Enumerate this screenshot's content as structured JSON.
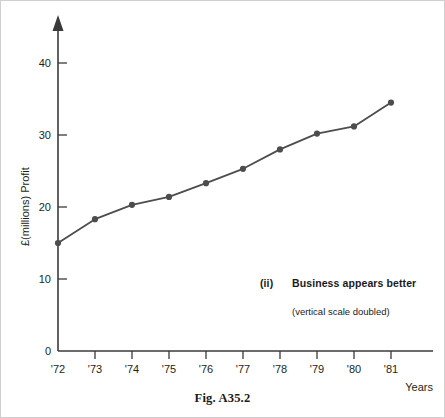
{
  "figure": {
    "caption": "Fig. A35.2"
  },
  "annotation": {
    "marker": "(ii)",
    "title": "Business appears better",
    "subtitle": "(vertical scale doubled)"
  },
  "chart_data": {
    "type": "line",
    "title": "",
    "xlabel": "Years",
    "ylabel": "£(millions) Profit",
    "categories": [
      "'72",
      "'73",
      "'74",
      "'75",
      "'76",
      "'77",
      "'78",
      "'79",
      "'80",
      "'81"
    ],
    "values": [
      15.0,
      18.3,
      20.3,
      21.4,
      23.3,
      25.3,
      28.0,
      30.2,
      31.2,
      34.5
    ],
    "series": [
      {
        "name": "Profit",
        "values": [
          15.0,
          18.3,
          20.3,
          21.4,
          23.3,
          25.3,
          28.0,
          30.2,
          31.2,
          34.5
        ]
      }
    ],
    "ylim": [
      0,
      45
    ],
    "yticks": [
      0,
      10,
      20,
      30,
      40
    ],
    "ytick_labels": [
      "0",
      "10",
      "20",
      "30",
      "40"
    ],
    "xtick_labels": [
      "'72",
      "'73",
      "'74",
      "'75",
      "'76",
      "'77",
      "'78",
      "'79",
      "'80",
      "'81"
    ],
    "grid": false,
    "legend": "none",
    "line_color": "#4d4d4d",
    "marker_color": "#4d4d4d",
    "axis_color": "#3a3a3a",
    "marker_shape": "circle"
  }
}
